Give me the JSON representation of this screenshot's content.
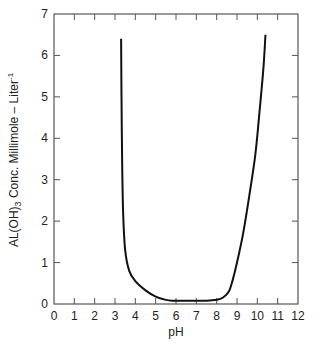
{
  "chart_data": {
    "type": "line",
    "title": "",
    "xlabel": "pH",
    "ylabel": "AL(OH)3 Conc. Millimole – Liter-1",
    "ylabel_parts": {
      "pre": "AL(OH)",
      "sub": "3",
      "mid": " Conc. Millimole – Liter",
      "sup": "-1"
    },
    "xlim": [
      0,
      12
    ],
    "ylim": [
      0,
      7
    ],
    "x_ticks": [
      "0",
      "1",
      "2",
      "3",
      "4",
      "5",
      "6",
      "7",
      "8",
      "9",
      "10",
      "11",
      "12"
    ],
    "y_ticks": [
      "0",
      "1",
      "2",
      "3",
      "4",
      "5",
      "6",
      "7"
    ],
    "grid": false,
    "series": [
      {
        "name": "Al(OH)3 solubility",
        "x": [
          3.3,
          3.32,
          3.35,
          3.4,
          3.5,
          3.7,
          4.0,
          4.5,
          5.0,
          5.5,
          5.8,
          6.5,
          7.5,
          8.0,
          8.3,
          8.6,
          8.8,
          9.0,
          9.3,
          9.6,
          9.9,
          10.1,
          10.3,
          10.4
        ],
        "values": [
          6.4,
          5.0,
          3.5,
          2.2,
          1.3,
          0.8,
          0.55,
          0.33,
          0.18,
          0.1,
          0.08,
          0.08,
          0.08,
          0.1,
          0.15,
          0.3,
          0.6,
          1.0,
          1.7,
          2.6,
          3.6,
          4.6,
          5.7,
          6.5
        ]
      }
    ]
  }
}
